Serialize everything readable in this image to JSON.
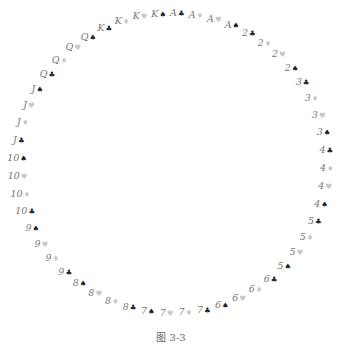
{
  "diagram": {
    "layout": "circle",
    "center": [
      172,
      163
    ],
    "radius_x": 155,
    "radius_y": 150,
    "start_angle_deg": -88,
    "direction": "clockwise",
    "cards": [
      {
        "rank": "A",
        "suit": "♣",
        "color": "black"
      },
      {
        "rank": "A",
        "suit": "♦",
        "color": "red"
      },
      {
        "rank": "A",
        "suit": "♥",
        "color": "red"
      },
      {
        "rank": "A",
        "suit": "♠",
        "color": "black"
      },
      {
        "rank": "2",
        "suit": "♣",
        "color": "black"
      },
      {
        "rank": "2",
        "suit": "♦",
        "color": "red"
      },
      {
        "rank": "2",
        "suit": "♥",
        "color": "red"
      },
      {
        "rank": "2",
        "suit": "♠",
        "color": "black"
      },
      {
        "rank": "3",
        "suit": "♣",
        "color": "black"
      },
      {
        "rank": "3",
        "suit": "♦",
        "color": "red"
      },
      {
        "rank": "3",
        "suit": "♥",
        "color": "red"
      },
      {
        "rank": "3",
        "suit": "♠",
        "color": "black"
      },
      {
        "rank": "4",
        "suit": "♣",
        "color": "black"
      },
      {
        "rank": "4",
        "suit": "♦",
        "color": "red"
      },
      {
        "rank": "4",
        "suit": "♥",
        "color": "red"
      },
      {
        "rank": "4",
        "suit": "♠",
        "color": "black"
      },
      {
        "rank": "5",
        "suit": "♣",
        "color": "black"
      },
      {
        "rank": "5",
        "suit": "♦",
        "color": "red"
      },
      {
        "rank": "5",
        "suit": "♥",
        "color": "red"
      },
      {
        "rank": "5",
        "suit": "♠",
        "color": "black"
      },
      {
        "rank": "6",
        "suit": "♣",
        "color": "black"
      },
      {
        "rank": "6",
        "suit": "♦",
        "color": "red"
      },
      {
        "rank": "6",
        "suit": "♥",
        "color": "red"
      },
      {
        "rank": "6",
        "suit": "♠",
        "color": "black"
      },
      {
        "rank": "7",
        "suit": "♣",
        "color": "black"
      },
      {
        "rank": "7",
        "suit": "♦",
        "color": "red"
      },
      {
        "rank": "7",
        "suit": "♥",
        "color": "red"
      },
      {
        "rank": "7",
        "suit": "♠",
        "color": "black"
      },
      {
        "rank": "8",
        "suit": "♣",
        "color": "black"
      },
      {
        "rank": "8",
        "suit": "♦",
        "color": "red"
      },
      {
        "rank": "8",
        "suit": "♥",
        "color": "red"
      },
      {
        "rank": "8",
        "suit": "♠",
        "color": "black"
      },
      {
        "rank": "9",
        "suit": "♣",
        "color": "black"
      },
      {
        "rank": "9",
        "suit": "♦",
        "color": "red"
      },
      {
        "rank": "9",
        "suit": "♥",
        "color": "red"
      },
      {
        "rank": "9",
        "suit": "♠",
        "color": "black"
      },
      {
        "rank": "10",
        "suit": "♣",
        "color": "black"
      },
      {
        "rank": "10",
        "suit": "♦",
        "color": "red"
      },
      {
        "rank": "10",
        "suit": "♥",
        "color": "red"
      },
      {
        "rank": "10",
        "suit": "♠",
        "color": "black"
      },
      {
        "rank": "J",
        "suit": "♣",
        "color": "black"
      },
      {
        "rank": "J",
        "suit": "♦",
        "color": "red"
      },
      {
        "rank": "J",
        "suit": "♥",
        "color": "red"
      },
      {
        "rank": "J",
        "suit": "♠",
        "color": "black"
      },
      {
        "rank": "Q",
        "suit": "♣",
        "color": "black"
      },
      {
        "rank": "Q",
        "suit": "♦",
        "color": "red"
      },
      {
        "rank": "Q",
        "suit": "♥",
        "color": "red"
      },
      {
        "rank": "Q",
        "suit": "♠",
        "color": "black"
      },
      {
        "rank": "K",
        "suit": "♣",
        "color": "black"
      },
      {
        "rank": "K",
        "suit": "♦",
        "color": "red"
      },
      {
        "rank": "K",
        "suit": "♥",
        "color": "red"
      },
      {
        "rank": "K",
        "suit": "♠",
        "color": "black"
      }
    ]
  },
  "caption": "图 3-3"
}
